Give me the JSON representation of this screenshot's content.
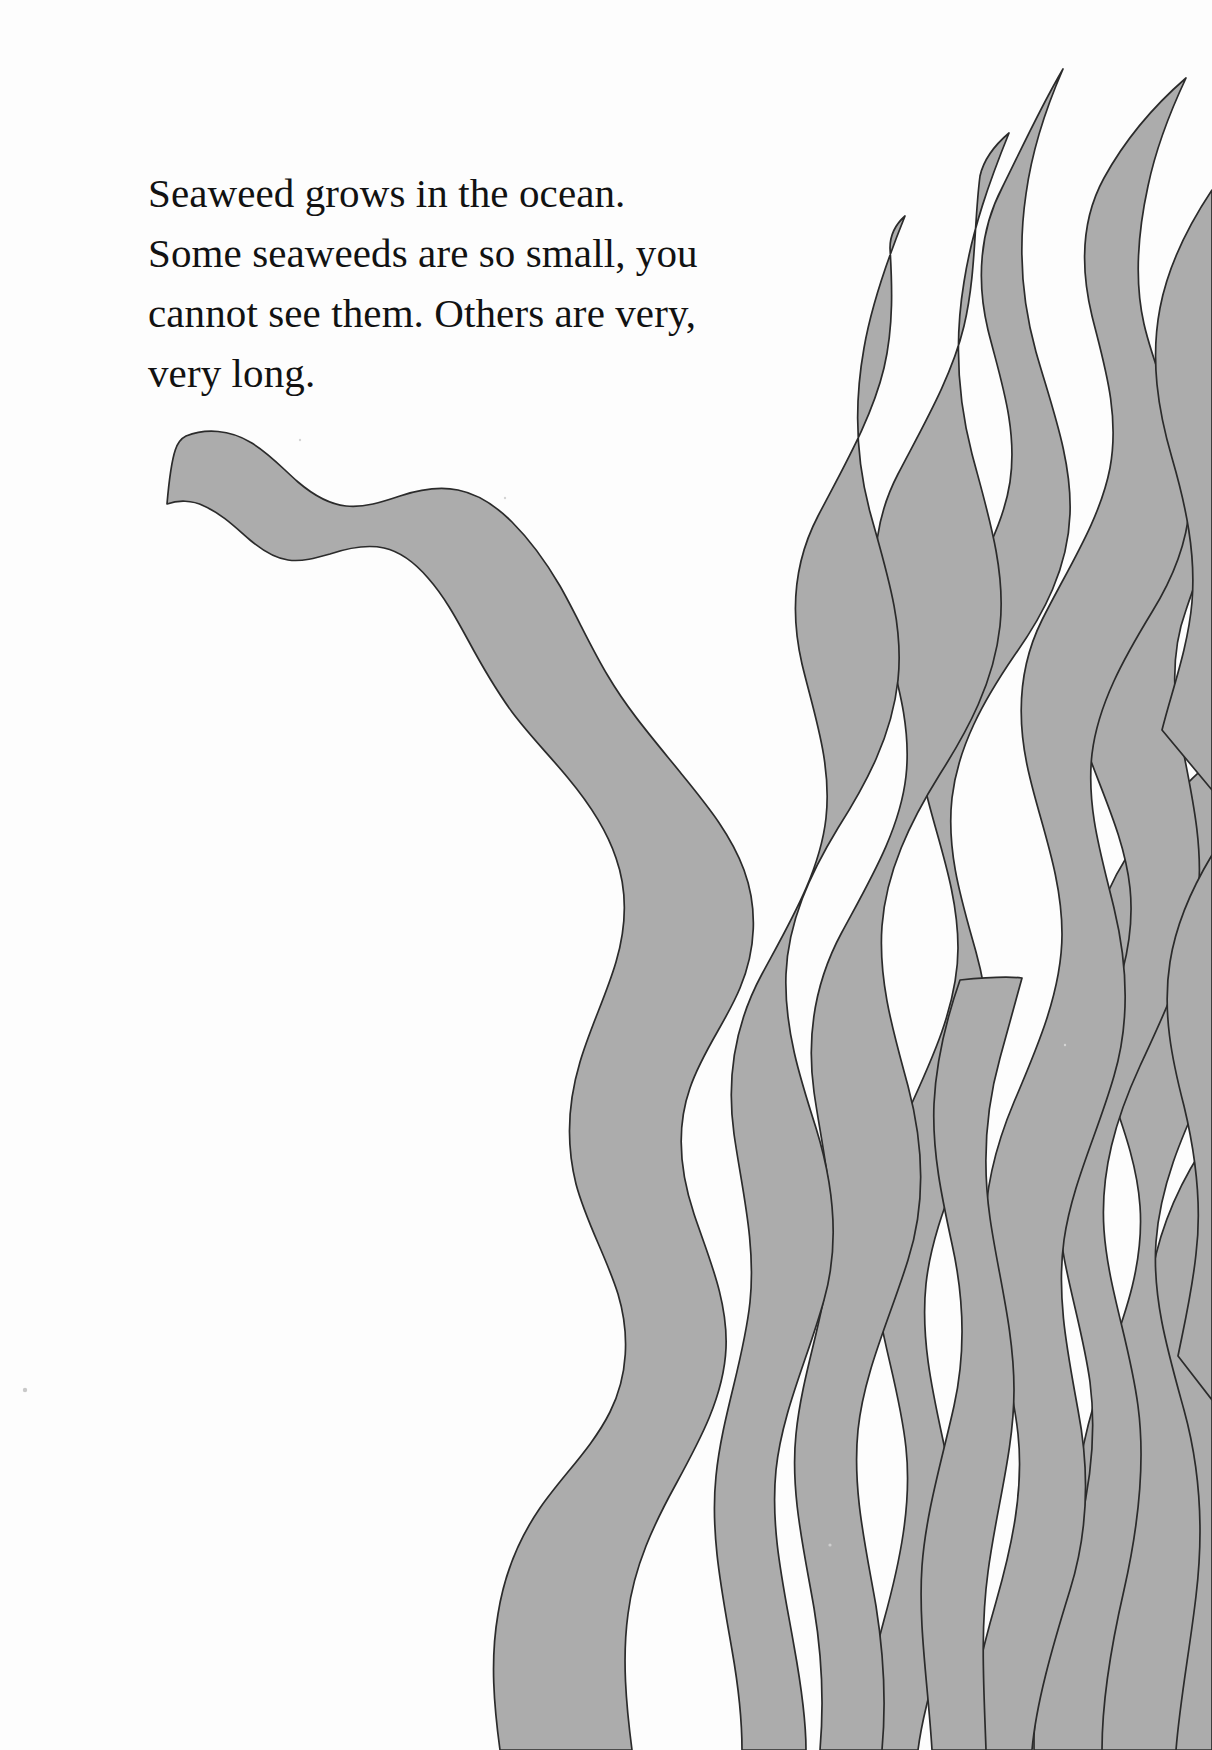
{
  "page": {
    "width": 1212,
    "height": 1750,
    "background_color": "#fdfdfd",
    "kind": "illustrated-childrens-book-page"
  },
  "body_text": {
    "lines": [
      "Seaweed grows in the ocean.",
      "Some seaweeds are so small, you",
      "cannot see them. Others are very,",
      "very long."
    ],
    "full_text": "Seaweed grows in the ocean. Some seaweeds are so small, you cannot see them. Others are very, very long.",
    "color": "#121212",
    "font_size_px": 41,
    "line_height_px": 60,
    "left_px": 148,
    "top_px": 163
  },
  "illustration": {
    "name": "seaweed-strands",
    "description": "Hand-drawn tapering seaweed ribbons rising from the bottom of the page, clustered at the right, with one long isolated strand curling in from the upper left.",
    "fill_color": "#acacac",
    "highlight_color": "#c3c3c3",
    "outline_color": "#2b2b2b",
    "outline_width_px": 1.7,
    "strand_count": 11,
    "strands": [
      {
        "id": "strand-isolated-left",
        "tip": [
          168,
          505
        ],
        "base": [
          640,
          1750
        ],
        "label": "long solitary strand with curled tip"
      },
      {
        "id": "strand-1",
        "tip": [
          905,
          216
        ],
        "base": [
          742,
          1750
        ],
        "label": "left cluster strand"
      },
      {
        "id": "strand-2",
        "tip": [
          1009,
          133
        ],
        "base": [
          835,
          1750
        ],
        "label": "inner cluster strand"
      },
      {
        "id": "strand-3",
        "tip": [
          1063,
          69
        ],
        "base": [
          900,
          1750
        ],
        "label": "crossing cluster strand"
      },
      {
        "id": "strand-4",
        "tip": [
          1186,
          78
        ],
        "base": [
          975,
          1750
        ],
        "label": "tall right strand"
      },
      {
        "id": "strand-5",
        "tip": [
          1212,
          190
        ],
        "base": [
          1045,
          1750
        ],
        "label": "edge strand upper"
      },
      {
        "id": "strand-6",
        "tip": [
          1212,
          430
        ],
        "base": [
          1110,
          1750
        ],
        "label": "edge strand middle"
      },
      {
        "id": "strand-7",
        "tip": [
          1212,
          760
        ],
        "base": [
          1180,
          1750
        ],
        "label": "edge strand lower"
      },
      {
        "id": "strand-8",
        "tip": [
          1212,
          855
        ],
        "base": [
          1212,
          1560
        ],
        "label": "short edge sliver"
      },
      {
        "id": "strand-9",
        "tip": [
          1212,
          1135
        ],
        "base": [
          1212,
          1750
        ],
        "label": "lower edge strand"
      },
      {
        "id": "strand-10",
        "tip": [
          960,
          980
        ],
        "base": [
          905,
          1750
        ],
        "label": "interior short strand"
      }
    ],
    "specks": [
      {
        "x": 25,
        "y": 1390,
        "size": 4
      },
      {
        "x": 300,
        "y": 440,
        "size": 2
      },
      {
        "x": 505,
        "y": 498,
        "size": 2
      },
      {
        "x": 830,
        "y": 1545,
        "size": 3
      },
      {
        "x": 1065,
        "y": 1045,
        "size": 2
      }
    ]
  }
}
